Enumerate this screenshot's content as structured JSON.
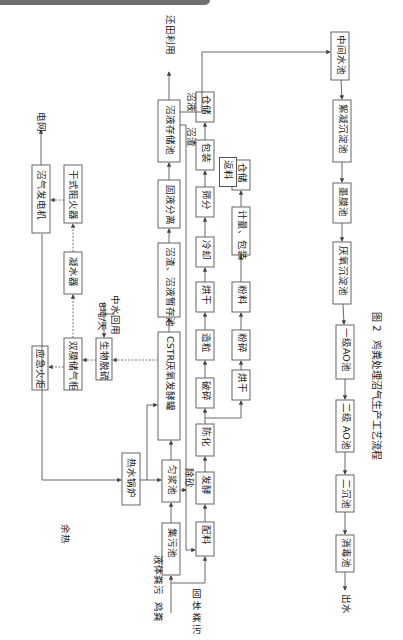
{
  "figure": {
    "caption_number": "图 2",
    "caption_title": "鸡粪处理沼气生产工艺流程"
  },
  "inputs": {
    "source": "鸡粪",
    "liquid": "液体粪污",
    "solid": "固体粪污"
  },
  "biogas_line": {
    "collection_pond": "集污池",
    "homogenizing_pond": "匀浆池",
    "boiler": "热水锅炉",
    "cstr": "CSTR厌氧发酵罐",
    "temp_storage": "沼渣、沼液暂存池",
    "separation": "固液分离",
    "slurry_storage": "沼液存储池",
    "field_use": "还田利用",
    "desulfur": "生物脱硫",
    "gas_holder": "双膜储气柜",
    "flare": "应急火炬",
    "condenser": "凝水器",
    "flame_arrester": "干式阻火器",
    "generator": "沼气发电机",
    "grid": "电网"
  },
  "labels": {
    "waste_heat": "余热",
    "sand_removal": "除砂",
    "digestate": "沼渣",
    "biogas_slurry": "沼液",
    "reuse_water": "中水回用",
    "reuse_rate": "8吨/天"
  },
  "fertilizer_line": {
    "mixing": "配料",
    "fermentation": "发酵",
    "aging": "陈化",
    "crushing": "破碎",
    "granulating": "造粒",
    "drying1": "烘干",
    "cooling": "冷却",
    "screening": "筛分",
    "return": "返料",
    "packing": "包装",
    "storage1": "仓储",
    "drying2": "烘干",
    "pulverize": "粉碎",
    "powder": "粉料",
    "weigh_pack": "计量、包装",
    "storage2": "仓储"
  },
  "water_line": {
    "intermediate": "中间水池",
    "coag_sed": "絮凝沉淀池",
    "membrane": "墨膜池",
    "anaerobic_sed": "厌氧沉淀池",
    "ao1": "一级AO池",
    "ao2": "二级 AO池",
    "secondary_sed": "二沉池",
    "disinfection": "消毒池",
    "effluent": "出水"
  }
}
